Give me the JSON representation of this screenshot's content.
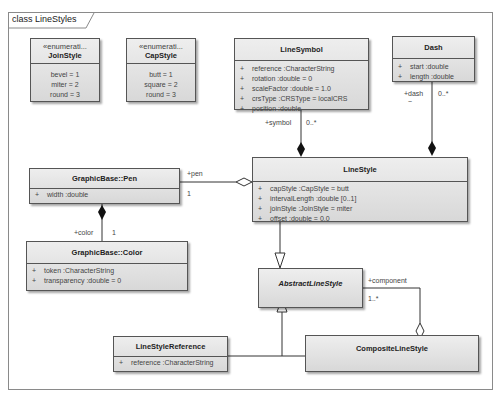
{
  "diagram": {
    "frame_label": "class LineStyles",
    "classes": {
      "join_style": {
        "stereotype": "«enumerati...",
        "name": "JoinStyle",
        "literals": [
          "bevel = 1",
          "miter = 2",
          "round = 3"
        ]
      },
      "cap_style": {
        "stereotype": "«enumerati...",
        "name": "CapStyle",
        "literals": [
          "butt = 1",
          "square = 2",
          "round = 3"
        ]
      },
      "line_symbol": {
        "name": "LineSymbol",
        "attributes": [
          {
            "vis": "+",
            "text": "reference  :CharacterString"
          },
          {
            "vis": "+",
            "text": "rotation  :double = 0"
          },
          {
            "vis": "+",
            "text": "scaleFactor  :double = 1.0"
          },
          {
            "vis": "+",
            "text": "crsType  :CRSType = localCRS"
          },
          {
            "vis": "+",
            "text": "position  :double"
          }
        ]
      },
      "dash": {
        "name": "Dash",
        "attributes": [
          {
            "vis": "+",
            "text": "start  :double"
          },
          {
            "vis": "+",
            "text": "length  :double"
          }
        ]
      },
      "pen": {
        "name": "GraphicBase::Pen",
        "attributes": [
          {
            "vis": "+",
            "text": "width  :double"
          }
        ]
      },
      "line_style": {
        "name": "LineStyle",
        "attributes": [
          {
            "vis": "+",
            "text": "capStyle  :CapStyle = butt"
          },
          {
            "vis": "+",
            "text": "intervalLength  :double [0..1]"
          },
          {
            "vis": "+",
            "text": "joinStyle  :JoinStyle = miter"
          },
          {
            "vis": "+",
            "text": "offset  :double = 0.0"
          }
        ]
      },
      "color": {
        "name": "GraphicBase::Color",
        "attributes": [
          {
            "vis": "+",
            "text": "token  :CharacterString"
          },
          {
            "vis": "+",
            "text": "transparency  :double = 0"
          }
        ]
      },
      "abstract_line_style": {
        "name": "AbstractLineStyle"
      },
      "line_style_reference": {
        "name": "LineStyleReference",
        "attributes": [
          {
            "vis": "+",
            "text": "reference  :CharacterString"
          }
        ]
      },
      "composite_line_style": {
        "name": "CompositeLineStyle"
      }
    },
    "associations": {
      "symbol": {
        "role": "+symbol",
        "multiplicity": "0..*"
      },
      "dash": {
        "role": "+dash",
        "multiplicity": "0..*",
        "extra": "~"
      },
      "pen": {
        "role": "+pen",
        "multiplicity": "1"
      },
      "color": {
        "role": "+color",
        "multiplicity": "1"
      },
      "component": {
        "role": "+component",
        "multiplicity": "1..*"
      }
    }
  }
}
